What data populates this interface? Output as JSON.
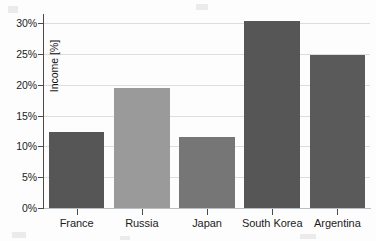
{
  "chart_data": {
    "type": "bar",
    "title": "",
    "xlabel": "",
    "ylabel": "Income [%]",
    "categories": [
      "France",
      "Russia",
      "Japan",
      "South Korea",
      "Argentina"
    ],
    "values": [
      12.4,
      19.5,
      11.5,
      30.3,
      24.8
    ],
    "value_labels": [
      "12.4%",
      "19.5%",
      "11.5%",
      "30.3%",
      "24.8%"
    ],
    "ylim": [
      0,
      31.5
    ],
    "yticks": [
      0,
      5,
      10,
      15,
      20,
      25,
      30
    ],
    "ytick_labels": [
      "0%",
      "5%",
      "10%",
      "15%",
      "20%",
      "25%",
      "30%"
    ],
    "grid": true,
    "legend": "none",
    "bar_colors": [
      "#565656",
      "#9a9a9a",
      "#767676",
      "#565656",
      "#5a5a5a"
    ],
    "series": [
      {
        "name": "Income [%]",
        "values": [
          12.4,
          19.5,
          11.5,
          30.3,
          24.8
        ]
      }
    ]
  },
  "axes": {
    "y_title": "Income [%]",
    "y_tick_labels": [
      "30%",
      "25%",
      "20%",
      "15%",
      "10%",
      "5%",
      "0%"
    ],
    "x_tick_labels": [
      "France",
      "Russia",
      "Japan",
      "South Korea",
      "Argentina"
    ]
  },
  "colors": {
    "background": "#fdfdfd",
    "gridline": "#d9dee3",
    "axis": "#4a4a4a",
    "text": "#1c1c1c"
  }
}
